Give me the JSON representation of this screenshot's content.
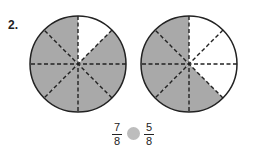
{
  "problem": {
    "number": "2.",
    "circles": [
      {
        "name": "left",
        "cx": 78,
        "cy": 64,
        "r": 48,
        "slices": 8,
        "shaded": 7,
        "unshaded_slices": [
          0
        ]
      },
      {
        "name": "right",
        "cx": 189,
        "cy": 64,
        "r": 48,
        "slices": 8,
        "shaded": 5,
        "unshaded_slices": [
          0,
          1,
          2
        ]
      }
    ],
    "colors": {
      "shade": "#a9a9a9",
      "stroke": "#222222",
      "dot": "#bdbdbd"
    },
    "left_fraction": {
      "numerator": "7",
      "denominator": "8"
    },
    "right_fraction": {
      "numerator": "5",
      "denominator": "8"
    }
  }
}
